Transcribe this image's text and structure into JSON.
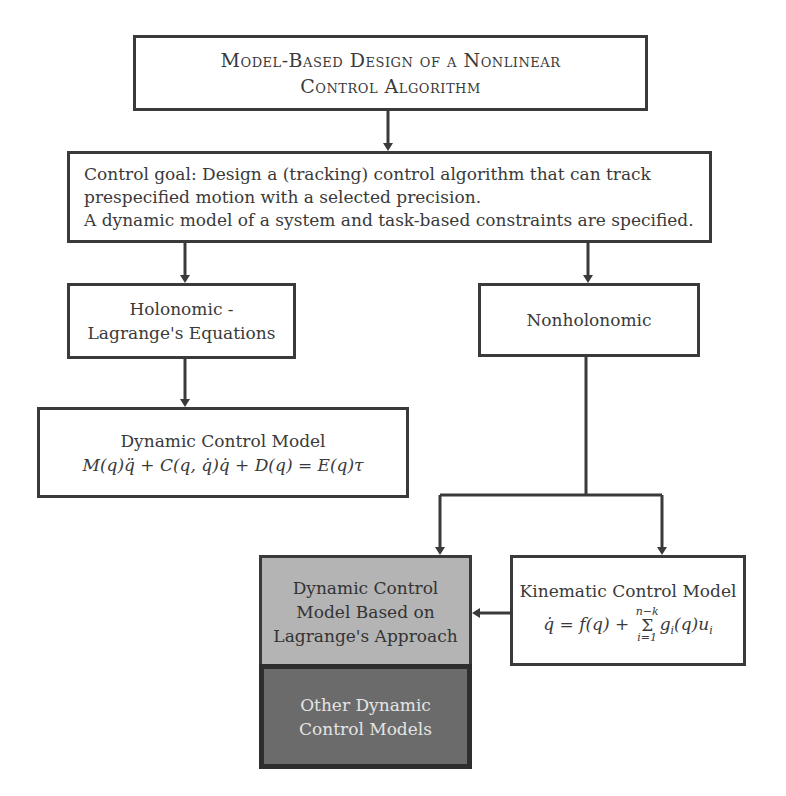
{
  "diagram": {
    "title_box": {
      "lines": [
        "Model-Based Design of a Nonlinear",
        "Control Algorithm"
      ]
    },
    "goal_box": {
      "lines": [
        "Control goal: Design a (tracking) control algorithm that can track",
        "prespecified motion with a selected precision.",
        "A dynamic model of a system and task-based constraints are specified."
      ]
    },
    "holonomic_box": {
      "lines": [
        "Holonomic -",
        "Lagrange's Equations"
      ]
    },
    "nonholonomic_box": {
      "lines": [
        "Nonholonomic"
      ]
    },
    "dynamic_model_box": {
      "title": "Dynamic Control Model",
      "equation": "M(q)q̈ + C(q, q̇)q̇ + D(q) = E(q)τ"
    },
    "lagrange_approach_box": {
      "lines": [
        "Dynamic Control",
        "Model Based on",
        "Lagrange's Approach"
      ],
      "fill": "#b4b4b4"
    },
    "other_models_box": {
      "lines": [
        "Other Dynamic",
        "Control Models"
      ],
      "fill": "#6b6b6b"
    },
    "kinematic_box": {
      "title": "Kinematic Control Model",
      "equation": {
        "lhs": "q̇ = f(q) + ",
        "sum_upper": "n−k",
        "sum_symbol": "Σ",
        "sum_lower": "i=1",
        "rhs": "g",
        "rhs_sub": "i",
        "rhs_tail": "(q)u",
        "tail_sub": "i"
      }
    },
    "colors": {
      "line": "#3a3a3a",
      "light_fill": "#b4b4b4",
      "dark_fill": "#6b6b6b",
      "dark_text": "#e4e4e4"
    }
  }
}
